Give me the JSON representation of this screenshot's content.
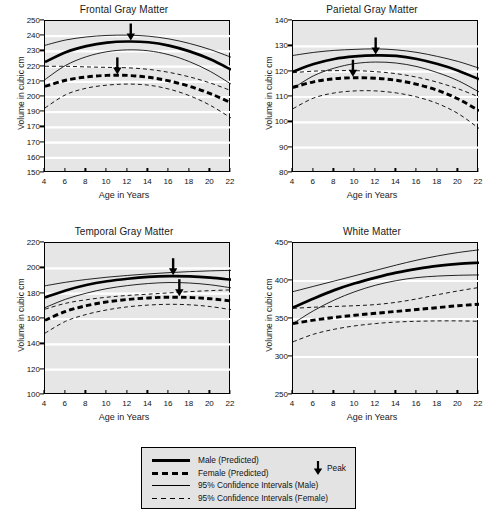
{
  "figure": {
    "ylabel": "Volume in cubic cm",
    "xlabel": "Age in Years"
  },
  "legend": {
    "items": [
      {
        "label": "Male (Predicted)",
        "style": "male-pred"
      },
      {
        "label": "Female (Predicted)",
        "style": "female-pred"
      },
      {
        "label": "95% Confidence Intervals (Male)",
        "style": "male-ci"
      },
      {
        "label": "95% Confidence Intervals (Female)",
        "style": "female-ci"
      }
    ],
    "peak_label": "Peak",
    "peak_icon": "down-arrow-icon"
  },
  "chart_data": [
    {
      "type": "line",
      "title": "Frontal Gray Matter",
      "xlabel": "Age in Years",
      "ylabel": "Volume in cubic cm",
      "xlim": [
        4,
        22
      ],
      "ylim": [
        150,
        250
      ],
      "xticks": [
        4,
        6,
        8,
        10,
        12,
        14,
        16,
        18,
        20,
        22
      ],
      "yticks": [
        250,
        240,
        230,
        220,
        210,
        200,
        190,
        170,
        170,
        160,
        150
      ],
      "ytick_values": [
        250,
        240,
        230,
        220,
        210,
        200,
        190,
        180,
        170,
        160,
        150
      ],
      "grid": "horizontal-white",
      "x": [
        4,
        6,
        8,
        10,
        12,
        14,
        16,
        18,
        20,
        22
      ],
      "series": [
        {
          "name": "Male (Predicted)",
          "style": "male-pred",
          "values": [
            223.0,
            229.5,
            233.5,
            235.8,
            236.5,
            236.0,
            233.8,
            230.0,
            224.8,
            218.0
          ]
        },
        {
          "name": "Female (Predicted)",
          "style": "female-pred",
          "values": [
            207.0,
            211.0,
            213.2,
            214.2,
            214.2,
            213.0,
            210.6,
            207.0,
            202.2,
            196.2
          ]
        },
        {
          "name": "95% CI Upper (Male)",
          "style": "male-ci",
          "values": [
            234.0,
            237.5,
            239.5,
            240.5,
            240.7,
            240.0,
            238.2,
            235.2,
            231.2,
            226.2
          ]
        },
        {
          "name": "95% CI Lower (Male)",
          "style": "male-ci",
          "values": [
            211.5,
            220.8,
            226.5,
            229.8,
            231.0,
            230.4,
            227.8,
            223.2,
            216.8,
            208.5
          ]
        },
        {
          "name": "95% CI Upper (Female)",
          "style": "female-ci",
          "values": [
            220.2,
            220.2,
            219.8,
            219.5,
            219.2,
            218.2,
            216.2,
            213.2,
            209.2,
            204.2
          ]
        },
        {
          "name": "95% CI Lower (Female)",
          "style": "female-ci",
          "values": [
            192.8,
            201.5,
            205.8,
            207.8,
            208.5,
            207.8,
            205.2,
            200.8,
            194.5,
            186.2
          ]
        }
      ],
      "annotations": [
        {
          "type": "peak-arrow",
          "series": "Male (Predicted)",
          "x": 12.3,
          "y": 236.5
        },
        {
          "type": "peak-arrow",
          "series": "Female (Predicted)",
          "x": 11.0,
          "y": 214.2
        }
      ]
    },
    {
      "type": "line",
      "title": "Parietal Gray Matter",
      "xlabel": "Age in Years",
      "ylabel": "Volume in cubic cm",
      "xlim": [
        4,
        22
      ],
      "ylim": [
        80,
        140
      ],
      "xticks": [
        4,
        6,
        8,
        10,
        12,
        14,
        16,
        18,
        20,
        22
      ],
      "yticks": [
        140,
        130,
        120,
        110,
        100,
        90,
        80
      ],
      "ytick_values": [
        140,
        130,
        120,
        110,
        100,
        90,
        80
      ],
      "grid": "horizontal-white",
      "x": [
        4,
        6,
        8,
        10,
        12,
        14,
        16,
        18,
        20,
        22
      ],
      "series": [
        {
          "name": "Male (Predicted)",
          "style": "male-pred",
          "values": [
            120.0,
            123.0,
            125.0,
            126.0,
            126.4,
            126.2,
            125.0,
            123.0,
            120.4,
            117.0
          ]
        },
        {
          "name": "Female (Predicted)",
          "style": "female-pred",
          "values": [
            113.8,
            116.0,
            117.2,
            117.6,
            117.4,
            116.6,
            115.0,
            112.6,
            109.2,
            104.6
          ]
        },
        {
          "name": "95% CI Upper (Male)",
          "style": "male-ci",
          "values": [
            126.4,
            127.6,
            128.4,
            128.8,
            129.0,
            128.6,
            127.6,
            126.0,
            124.0,
            121.4
          ]
        },
        {
          "name": "95% CI Lower (Male)",
          "style": "male-ci",
          "values": [
            113.4,
            118.4,
            121.4,
            123.2,
            123.8,
            123.4,
            122.0,
            119.6,
            116.4,
            112.0
          ]
        },
        {
          "name": "95% CI Upper (Female)",
          "style": "female-ci",
          "values": [
            119.6,
            120.2,
            120.4,
            120.4,
            120.0,
            119.2,
            117.8,
            115.8,
            113.2,
            110.0
          ]
        },
        {
          "name": "95% CI Lower (Female)",
          "style": "female-ci",
          "values": [
            105.4,
            109.6,
            111.6,
            112.4,
            112.4,
            111.6,
            110.0,
            107.4,
            103.4,
            97.6
          ]
        }
      ],
      "annotations": [
        {
          "type": "peak-arrow",
          "series": "Male (Predicted)",
          "x": 12.0,
          "y": 126.4
        },
        {
          "type": "peak-arrow",
          "series": "Female (Predicted)",
          "x": 9.8,
          "y": 117.6
        }
      ]
    },
    {
      "type": "line",
      "title": "Temporal Gray Matter",
      "xlabel": "Age in Years",
      "ylabel": "Volume in cubic cm",
      "xlim": [
        4,
        22
      ],
      "ylim": [
        100,
        220
      ],
      "xticks": [
        4,
        6,
        8,
        10,
        12,
        14,
        16,
        18,
        20,
        22
      ],
      "yticks": [
        220,
        200,
        180,
        160,
        140,
        120,
        100
      ],
      "ytick_values": [
        220,
        200,
        180,
        160,
        140,
        120,
        100
      ],
      "grid": "horizontal-white",
      "x": [
        4,
        6,
        8,
        10,
        12,
        14,
        16,
        18,
        20,
        22
      ],
      "series": [
        {
          "name": "Male (Predicted)",
          "style": "male-pred",
          "values": [
            177.0,
            182.5,
            186.8,
            189.8,
            191.8,
            193.2,
            193.8,
            193.6,
            192.6,
            191.0
          ]
        },
        {
          "name": "Female (Predicted)",
          "style": "female-pred",
          "values": [
            159.0,
            166.0,
            170.5,
            173.5,
            175.4,
            176.6,
            177.2,
            177.0,
            176.0,
            174.2
          ]
        },
        {
          "name": "95% CI Upper (Male)",
          "style": "male-ci",
          "values": [
            186.2,
            189.0,
            191.2,
            193.0,
            194.4,
            195.6,
            196.6,
            197.4,
            198.0,
            198.4
          ]
        },
        {
          "name": "95% CI Lower (Male)",
          "style": "male-ci",
          "values": [
            169.0,
            175.6,
            180.4,
            184.0,
            186.4,
            188.0,
            188.8,
            188.4,
            187.0,
            184.6
          ]
        },
        {
          "name": "95% CI Upper (Female)",
          "style": "female-ci",
          "values": [
            167.8,
            172.4,
            175.2,
            177.2,
            178.6,
            179.6,
            180.6,
            181.6,
            182.4,
            183.0
          ]
        },
        {
          "name": "95% CI Lower (Female)",
          "style": "female-ci",
          "values": [
            148.8,
            158.2,
            163.6,
            167.2,
            169.6,
            171.0,
            171.6,
            171.2,
            169.8,
            167.4
          ]
        }
      ],
      "annotations": [
        {
          "type": "peak-arrow",
          "series": "Male (Predicted)",
          "x": 16.4,
          "y": 193.8
        },
        {
          "type": "peak-arrow",
          "series": "Female (Predicted)",
          "x": 17.0,
          "y": 177.2
        }
      ]
    },
    {
      "type": "line",
      "title": "White Matter",
      "xlabel": "Age in Years",
      "ylabel": "Volume in cubic cm",
      "xlim": [
        4,
        22
      ],
      "ylim": [
        250,
        450
      ],
      "xticks": [
        4,
        6,
        8,
        10,
        12,
        14,
        16,
        18,
        20,
        22
      ],
      "yticks": [
        450,
        400,
        350,
        300,
        250
      ],
      "ytick_values": [
        450,
        400,
        350,
        300,
        250
      ],
      "grid": "horizontal-white",
      "x": [
        4,
        6,
        8,
        10,
        12,
        14,
        16,
        18,
        20,
        22
      ],
      "series": [
        {
          "name": "Male (Predicted)",
          "style": "male-pred",
          "values": [
            365.0,
            377.0,
            388.0,
            397.0,
            404.5,
            411.0,
            416.0,
            420.0,
            422.5,
            424.0
          ]
        },
        {
          "name": "Female (Predicted)",
          "style": "female-pred",
          "values": [
            344.0,
            348.5,
            352.0,
            355.0,
            357.5,
            360.0,
            362.5,
            365.0,
            367.5,
            369.5
          ]
        },
        {
          "name": "95% CI Upper (Male)",
          "style": "male-ci",
          "values": [
            386.0,
            393.0,
            400.0,
            407.0,
            414.0,
            421.0,
            427.5,
            433.0,
            437.5,
            441.0
          ]
        },
        {
          "name": "95% CI Lower (Male)",
          "style": "male-ci",
          "values": [
            344.0,
            361.0,
            375.0,
            386.0,
            394.5,
            400.5,
            404.5,
            406.5,
            407.5,
            408.0
          ]
        },
        {
          "name": "95% CI Upper (Female)",
          "style": "female-ci",
          "values": [
            364.0,
            365.5,
            366.5,
            367.5,
            369.0,
            372.0,
            376.5,
            382.0,
            387.0,
            391.5
          ]
        },
        {
          "name": "95% CI Lower (Female)",
          "style": "female-ci",
          "values": [
            320.0,
            330.0,
            336.5,
            341.0,
            344.0,
            346.0,
            347.0,
            347.5,
            347.5,
            347.0
          ]
        }
      ],
      "annotations": []
    }
  ]
}
